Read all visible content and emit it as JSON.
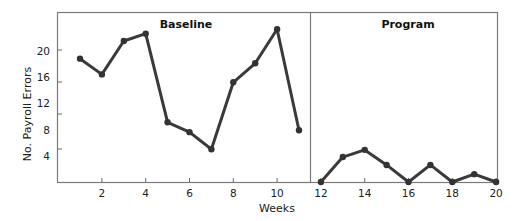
{
  "chart_data": {
    "type": "line",
    "title": "",
    "xlabel": "Weeks",
    "ylabel": "No. Payroll Errors",
    "xlim": [
      0,
      20
    ],
    "ylim": [
      0,
      25
    ],
    "grid": false,
    "legend": null,
    "x_ticks": [
      2,
      4,
      6,
      8,
      10,
      12,
      14,
      16,
      18,
      20
    ],
    "y_ticks": [
      4,
      8,
      12,
      16,
      20
    ],
    "phases": [
      {
        "name": "Baseline",
        "x_range": [
          0,
          11.5
        ]
      },
      {
        "name": "Program",
        "x_range": [
          11.5,
          20
        ]
      }
    ],
    "series": [
      {
        "name": "Baseline",
        "x": [
          1,
          2,
          3,
          4,
          5,
          6,
          7,
          8,
          9,
          10,
          11
        ],
        "values": [
          18.8,
          16.4,
          21.5,
          22.6,
          9.1,
          7.6,
          5.0,
          15.2,
          18.1,
          23.3,
          7.9
        ]
      },
      {
        "name": "Program",
        "x": [
          12,
          13,
          14,
          15,
          16,
          17,
          18,
          19,
          20
        ],
        "values": [
          0,
          3.8,
          4.9,
          2.6,
          0,
          2.6,
          0,
          1.2,
          0
        ]
      }
    ]
  },
  "labels": {
    "baseline": "Baseline",
    "program": "Program",
    "xlabel": "Weeks",
    "ylabel": "No. Payroll Errors"
  },
  "colors": {
    "line": "#3a3a3a",
    "frame": "#7a7a7a"
  }
}
